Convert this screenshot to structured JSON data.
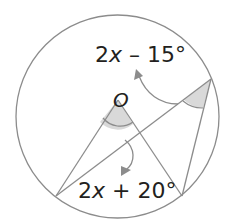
{
  "diagram": {
    "type": "circle-geometry",
    "center_label": "O",
    "angle_labels": {
      "inscribed": {
        "coef": "2",
        "var": "x",
        "rest": " – 15°",
        "full": "2x – 15°"
      },
      "central": {
        "coef": "2",
        "var": "x",
        "rest": " + 20°",
        "full": "2x + 20°"
      }
    },
    "colors": {
      "stroke": "#8c8c8c",
      "shade": "#d9d9d9",
      "text": "#231f20"
    }
  }
}
